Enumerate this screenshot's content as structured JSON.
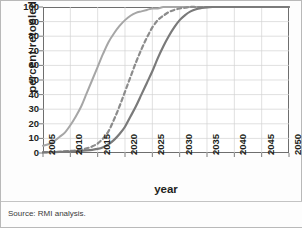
{
  "figure": {
    "source_note": "Source: RMI analysis.",
    "border_color": "#b9b9b9"
  },
  "chart_data": {
    "type": "line",
    "title": "",
    "xlabel": "year",
    "ylabel": "percent retooled",
    "xlim": [
      2005,
      2050
    ],
    "ylim": [
      0,
      100
    ],
    "grid": true,
    "legend": "none",
    "xticks": [
      2005,
      2010,
      2015,
      2020,
      2025,
      2030,
      2035,
      2040,
      2045,
      2050
    ],
    "yticks": [
      0,
      10,
      20,
      30,
      40,
      50,
      60,
      70,
      80,
      90,
      100
    ],
    "x": [
      2005,
      2006,
      2007,
      2008,
      2009,
      2010,
      2011,
      2012,
      2013,
      2014,
      2015,
      2016,
      2017,
      2018,
      2019,
      2020,
      2021,
      2022,
      2023,
      2024,
      2025,
      2026,
      2027,
      2028,
      2029,
      2030,
      2031,
      2032,
      2033,
      2034,
      2035,
      2036,
      2037,
      2038,
      2039,
      2040,
      2041,
      2042,
      2043,
      2044,
      2045,
      2046,
      2047,
      2048,
      2049,
      2050
    ],
    "series": [
      {
        "name": "fast retooling",
        "style": "solid",
        "color": "#a6a6a6",
        "width": 2.0,
        "midpoint_year": 2014.5,
        "values": [
          5,
          6,
          8,
          11,
          14,
          19,
          25,
          32,
          41,
          50,
          59,
          68,
          76,
          82,
          87,
          91,
          94,
          96,
          97,
          98,
          99,
          99,
          100,
          100,
          100,
          100,
          100,
          100,
          100,
          100,
          100,
          100,
          100,
          100,
          100,
          100,
          100,
          100,
          100,
          100,
          100,
          100,
          100,
          100,
          100,
          100
        ]
      },
      {
        "name": "medium retooling",
        "style": "dashed",
        "color": "#8c8c8c",
        "width": 2.2,
        "midpoint_year": 2022.6,
        "values": [
          0.5,
          0.6,
          0.7,
          0.9,
          1.1,
          1.4,
          1.8,
          2.4,
          3.2,
          4.5,
          6.5,
          10,
          15,
          23,
          32,
          42,
          52,
          62,
          71,
          79,
          86,
          91,
          94,
          96.5,
          98,
          99,
          99.5,
          100,
          100,
          100,
          100,
          100,
          100,
          100,
          100,
          100,
          100,
          100,
          100,
          100,
          100,
          100,
          100,
          100,
          100,
          100
        ]
      },
      {
        "name": "slow retooling",
        "style": "solid",
        "color": "#7a7a7a",
        "width": 2.2,
        "midpoint_year": 2025.4,
        "values": [
          0.4,
          0.5,
          0.6,
          0.7,
          0.9,
          1.0,
          1.2,
          1.5,
          1.8,
          2.2,
          2.8,
          4,
          6,
          9,
          13,
          18,
          25,
          32,
          40,
          48,
          56,
          65,
          73,
          80,
          86,
          91,
          94.5,
          97,
          98.5,
          99.3,
          99.8,
          100,
          100,
          100,
          100,
          100,
          100,
          100,
          100,
          100,
          100,
          100,
          100,
          100,
          100,
          100
        ]
      }
    ]
  }
}
